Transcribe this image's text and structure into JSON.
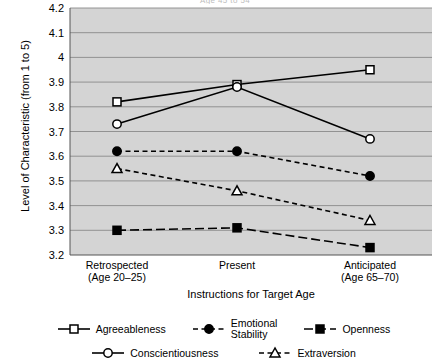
{
  "title_clipped": "Age 45 to 54",
  "axes": {
    "ylabel": "Level of Characteristic (from 1 to 5)",
    "xlabel": "Instructions for Target Age",
    "yticks": [
      "4.2",
      "4.1",
      "4",
      "3.9",
      "3.8",
      "3.7",
      "3.6",
      "3.5",
      "3.4",
      "3.3",
      "3.2"
    ],
    "xticks": [
      {
        "line1": "Retrospected",
        "line2": "(Age 20–25)"
      },
      {
        "line1": "Present",
        "line2": ""
      },
      {
        "line1": "Anticipated",
        "line2": "(Age 65–70)"
      }
    ]
  },
  "legend": {
    "row1": [
      "Agreeableness",
      "Emotional\nStability",
      "Openness"
    ],
    "row2": [
      "Conscientiousness",
      "Extraversion"
    ]
  },
  "colors": {
    "plot_background": "#d4d4d4",
    "gridline": "#8a8a8a",
    "line": "#000000",
    "page_background": "#ffffff"
  },
  "chart_data": {
    "type": "line",
    "title": "Age 45 to 54",
    "xlabel": "Instructions for Target Age",
    "ylabel": "Level of Characteristic (from 1 to 5)",
    "categories": [
      "Retrospected (Age 20–25)",
      "Present",
      "Anticipated (Age 65–70)"
    ],
    "ylim": [
      3.2,
      4.2
    ],
    "ytick_step": 0.1,
    "grid": "horizontal",
    "legend_position": "bottom",
    "series": [
      {
        "name": "Agreeableness",
        "marker": "open-square",
        "linestyle": "solid",
        "values": [
          3.82,
          3.89,
          3.95
        ]
      },
      {
        "name": "Conscientiousness",
        "marker": "open-circle",
        "linestyle": "solid",
        "values": [
          3.73,
          3.88,
          3.67
        ]
      },
      {
        "name": "Emotional Stability",
        "marker": "filled-circle",
        "linestyle": "dashed",
        "values": [
          3.62,
          3.62,
          3.52
        ]
      },
      {
        "name": "Extraversion",
        "marker": "open-triangle",
        "linestyle": "dashed",
        "values": [
          3.55,
          3.46,
          3.34
        ]
      },
      {
        "name": "Openness",
        "marker": "filled-square",
        "linestyle": "long-dash",
        "values": [
          3.3,
          3.31,
          3.23
        ]
      }
    ]
  }
}
